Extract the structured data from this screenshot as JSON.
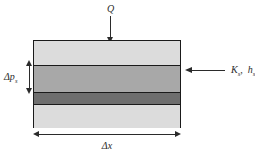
{
  "diagram": {
    "heat_flux": {
      "label": "Q",
      "arrow": "down-arrow-icon",
      "direction": "down"
    },
    "boundary_condition": {
      "label_k": "K",
      "label_k_sub": "s",
      "separator": ",",
      "label_h": "h",
      "label_h_sub": "s",
      "full_label": "K s ,  h s",
      "arrow": "left-arrow-icon",
      "direction": "left"
    },
    "thickness": {
      "label_main": "Δp",
      "label_sub": "s",
      "arrow": "vertical-double-arrow-icon"
    },
    "width": {
      "label_main": "Δx",
      "arrow": "horizontal-double-arrow-icon"
    },
    "layers": [
      {
        "name": "top-layer",
        "shade": "#dcdcdc"
      },
      {
        "name": "middle-layer",
        "shade": "#a8a8a8"
      },
      {
        "name": "dark-interface-layer",
        "shade": "#6e6e6e"
      },
      {
        "name": "bottom-layer",
        "shade": "#dcdcdc"
      }
    ],
    "colors": {
      "stroke": "#1a1a1a",
      "text": "#2b2b2b",
      "background": "#ffffff"
    }
  }
}
